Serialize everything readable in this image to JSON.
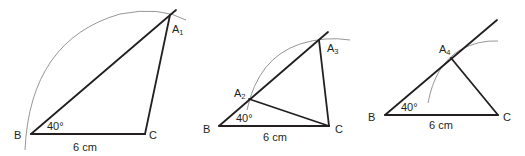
{
  "figures": [
    {
      "id": "fig1",
      "vertices": {
        "B": "B",
        "C": "C",
        "A": "A",
        "A_sub": "1"
      },
      "angle_label": "40°",
      "base_label": "6 cm"
    },
    {
      "id": "fig2",
      "vertices": {
        "B": "B",
        "C": "C",
        "A2": "A",
        "A2_sub": "2",
        "A3": "A",
        "A3_sub": "3"
      },
      "angle_label": "40°",
      "base_label": "6 cm"
    },
    {
      "id": "fig3",
      "vertices": {
        "B": "B",
        "C": "C",
        "A": "A",
        "A_sub": "4"
      },
      "angle_label": "40°",
      "base_label": "6 cm"
    }
  ],
  "colors": {
    "line": "#231f20",
    "arc": "#8a8a8a"
  }
}
